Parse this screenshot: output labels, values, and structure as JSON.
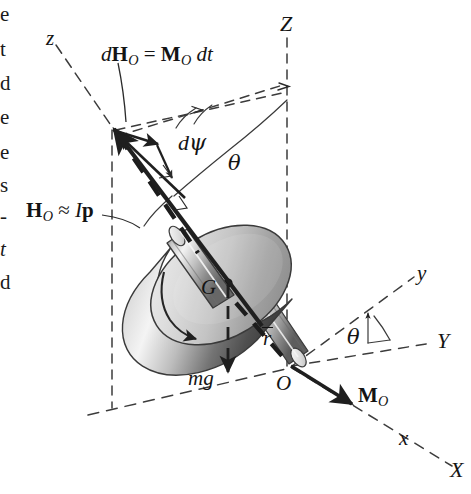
{
  "figure": {
    "width": 471,
    "height": 494,
    "background": "#ffffff",
    "ink": "#141414"
  },
  "axes": {
    "fixed": [
      {
        "name": "Z-axis",
        "label": "Z",
        "style": "dashed",
        "orientation": "vertical-up"
      },
      {
        "name": "Y-axis",
        "label": "Y",
        "style": "dashed",
        "orientation": "right-horizontal"
      },
      {
        "name": "X-axis",
        "label": "X",
        "style": "dashed",
        "orientation": "lower-right"
      }
    ],
    "rotating": [
      {
        "name": "z-axis",
        "label": "z",
        "style": "dashed",
        "orientation": "upper-left"
      },
      {
        "name": "y-axis",
        "label": "y",
        "style": "dashed",
        "orientation": "upper-right"
      },
      {
        "name": "x-axis",
        "label": "x",
        "style": "dashed",
        "orientation": "lower-right"
      }
    ]
  },
  "labels": {
    "dH_equation": {
      "d": "d",
      "H": "H",
      "H_sub": "O",
      "equals": "=",
      "M": "M",
      "M_sub": "O",
      "dt": "dt"
    },
    "H_momentum": {
      "H": "H",
      "H_sub": "O",
      "approx": "≈",
      "I": "I",
      "p": "p"
    },
    "dpsi": {
      "d": "d",
      "psi": "ψ"
    },
    "theta_top": "θ",
    "theta_bottom": "θ",
    "center_of_mass": "G",
    "origin": "O",
    "weight": "mg",
    "position_vector": "r",
    "moment": {
      "M": "M",
      "M_sub": "O"
    },
    "z_axis": "z",
    "Z_axis": "Z",
    "y_axis": "y",
    "Y_axis": "Y",
    "x_axis": "x",
    "X_axis": "X"
  },
  "margin_text_fragments": [
    {
      "char": "e",
      "top": 2
    },
    {
      "char": "t",
      "top": 37
    },
    {
      "char": "d",
      "top": 71
    },
    {
      "char": "e",
      "top": 105
    },
    {
      "char": "e",
      "top": 140
    },
    {
      "char": "s",
      "top": 173
    },
    {
      "char": "-",
      "top": 204
    },
    {
      "char": "t",
      "top": 237
    },
    {
      "char": "d",
      "top": 270
    }
  ],
  "colors": {
    "ink": "#141414",
    "dash": "#3a3a3a",
    "disk_face_light": "#e8e8e8",
    "disk_face_mid": "#c9c9c9",
    "disk_face_dark": "#9a9a9a",
    "disk_rim_dark": "#5e5e5e",
    "disk_rim_light": "#f2f2f2",
    "shaft_light": "#e3e3e3",
    "shaft_dark": "#7d7d7d",
    "vector": "#2b2b2b"
  },
  "vectors": [
    {
      "name": "angular-momentum-vector",
      "label": "H_O",
      "style": "solid-arrow",
      "direction": "up-left along spin axis"
    },
    {
      "name": "dH-increment-vector",
      "label": "dH_O",
      "style": "solid-arrow",
      "direction": "horizontal at tip"
    },
    {
      "name": "weight-vector",
      "label": "mg",
      "style": "dashed-arrow",
      "direction": "straight down"
    },
    {
      "name": "moment-vector",
      "label": "M_O",
      "style": "solid-arrow",
      "direction": "lower-right along x"
    },
    {
      "name": "spin-arrow",
      "label": "",
      "style": "curved-arrow",
      "direction": "counterclockwise on disk face"
    },
    {
      "name": "position-vector",
      "label": "r",
      "style": "dashed-arrow",
      "direction": "from O toward G"
    }
  ]
}
